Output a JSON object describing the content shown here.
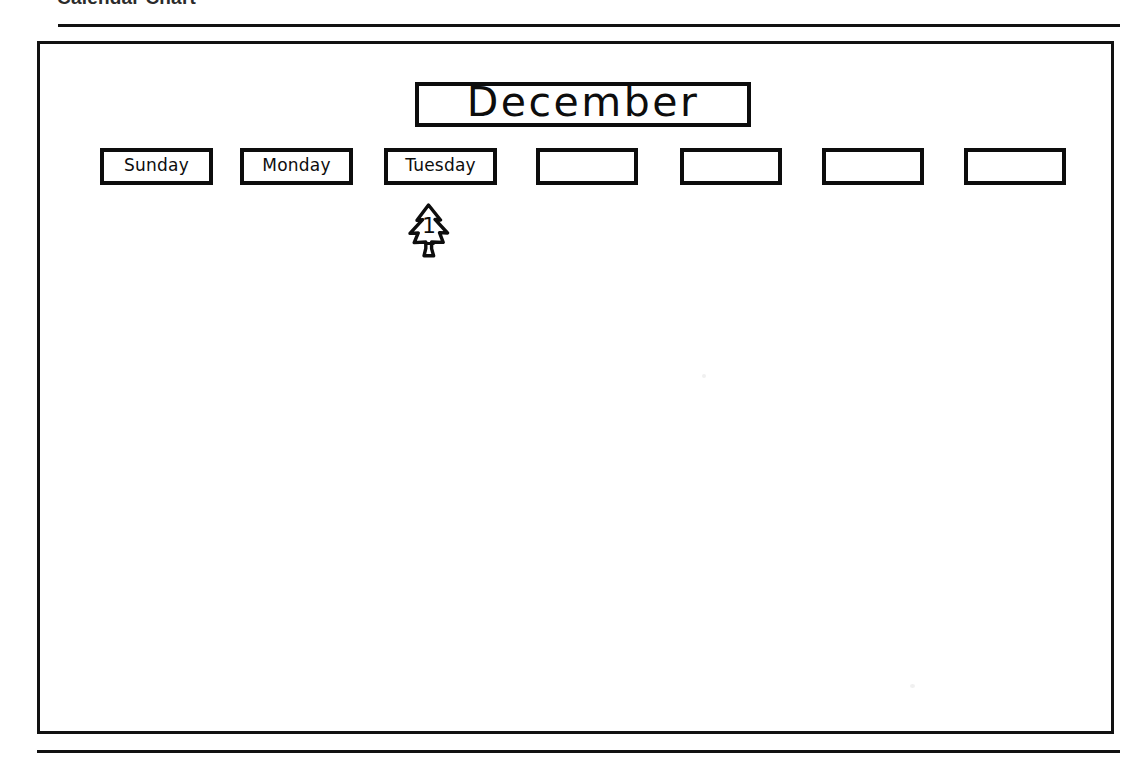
{
  "page": {
    "header_title": "Calendar Chart"
  },
  "calendar": {
    "month": "December",
    "day_headers": [
      {
        "label": "Sunday",
        "filled": true
      },
      {
        "label": "Monday",
        "filled": true
      },
      {
        "label": "Tuesday",
        "filled": true
      },
      {
        "label": "",
        "filled": false
      },
      {
        "label": "",
        "filled": false
      },
      {
        "label": "",
        "filled": false
      },
      {
        "label": "",
        "filled": false
      }
    ],
    "entries": [
      {
        "column": 2,
        "day_number": "1",
        "icon": "christmas-tree-icon"
      }
    ]
  },
  "colors": {
    "ink": "#0d0d0d",
    "rule": "#111111",
    "paper": "#ffffff",
    "header_text": "#2b2b2b"
  }
}
